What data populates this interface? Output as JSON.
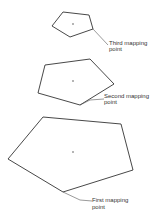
{
  "diagram": {
    "title": "",
    "shapes": [
      {
        "id": "small-pentagon",
        "label_lines": [
          "Third mapping",
          "point"
        ]
      },
      {
        "id": "medium-pentagon",
        "label_lines": [
          "Second mapping",
          "point"
        ]
      },
      {
        "id": "large-pentagon",
        "label_lines": [
          "First mapping",
          "point"
        ]
      }
    ],
    "colors": {
      "stroke": "#333333",
      "background": "#ffffff"
    }
  }
}
